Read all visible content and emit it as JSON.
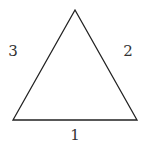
{
  "diagram": {
    "shape": "equilateral-triangle",
    "stroke_color": "#222222",
    "vertices": {
      "apex": [
        75,
        10
      ],
      "bottom_left": [
        13,
        120
      ],
      "bottom_right": [
        137,
        120
      ]
    },
    "side_labels": {
      "bottom": "1",
      "right": "2",
      "left": "3"
    }
  }
}
